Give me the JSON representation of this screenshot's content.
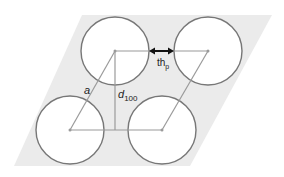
{
  "diagram": {
    "title": "",
    "colors": {
      "background_region": "#ebebeb",
      "circle_stroke": "#777777",
      "circle_fill": "#ffffff",
      "lattice_line": "#9a9a9a",
      "arrow": "#111111"
    },
    "labels": {
      "lattice_parameter": "a",
      "interplanar_spacing_base": "d",
      "interplanar_spacing_sub": "100",
      "pore_wall_thickness_base": "th",
      "pore_wall_thickness_sub": "p"
    },
    "pores": [
      {
        "name": "top-left",
        "cx": 115,
        "cy": 51,
        "r": 34
      },
      {
        "name": "top-right",
        "cx": 208,
        "cy": 51,
        "r": 34
      },
      {
        "name": "bottom-left",
        "cx": 70,
        "cy": 130,
        "r": 34
      },
      {
        "name": "bottom-right",
        "cx": 162,
        "cy": 130,
        "r": 34
      }
    ]
  }
}
